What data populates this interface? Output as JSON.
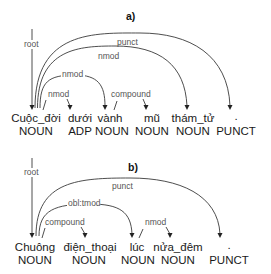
{
  "panels": [
    {
      "title": "a)",
      "tokens": [
        {
          "word": "Cuộc_đời",
          "pos": "NOUN"
        },
        {
          "word": "dưới",
          "pos": "ADP"
        },
        {
          "word": "vành",
          "pos": "NOUN"
        },
        {
          "word": "mũ",
          "pos": "NOUN"
        },
        {
          "word": "thám_tử",
          "pos": "NOUN"
        },
        {
          "word": ".",
          "pos": "PUNCT"
        }
      ],
      "arcs": [
        {
          "label": "root",
          "head": null,
          "dependent": "Cuộc_đời"
        },
        {
          "label": "punct",
          "head": "Cuộc_đời",
          "dependent": "."
        },
        {
          "label": "nmod",
          "head": "Cuộc_đời",
          "dependent": "thám_tử"
        },
        {
          "label": "nmod",
          "head": "Cuộc_đời",
          "dependent": "vành"
        },
        {
          "label": "nmod",
          "head": "Cuộc_đời",
          "dependent": "dưới"
        },
        {
          "label": "compound",
          "head": "vành",
          "dependent": "mũ"
        }
      ]
    },
    {
      "title": "b)",
      "tokens": [
        {
          "word": "Chuông",
          "pos": "NOUN"
        },
        {
          "word": "điện_thoại",
          "pos": "NOUN"
        },
        {
          "word": "lúc",
          "pos": "NOUN"
        },
        {
          "word": "nửa_đêm",
          "pos": "NOUN"
        },
        {
          "word": ".",
          "pos": "PUNCT"
        }
      ],
      "arcs": [
        {
          "label": "root",
          "head": null,
          "dependent": "Chuông"
        },
        {
          "label": "punct",
          "head": "Chuông",
          "dependent": "."
        },
        {
          "label": "obl:tmod",
          "head": "Chuông",
          "dependent": "lúc"
        },
        {
          "label": "compound",
          "head": "Chuông",
          "dependent": "điện_thoại"
        },
        {
          "label": "nmod",
          "head": "lúc",
          "dependent": "nửa_đêm"
        }
      ]
    }
  ]
}
